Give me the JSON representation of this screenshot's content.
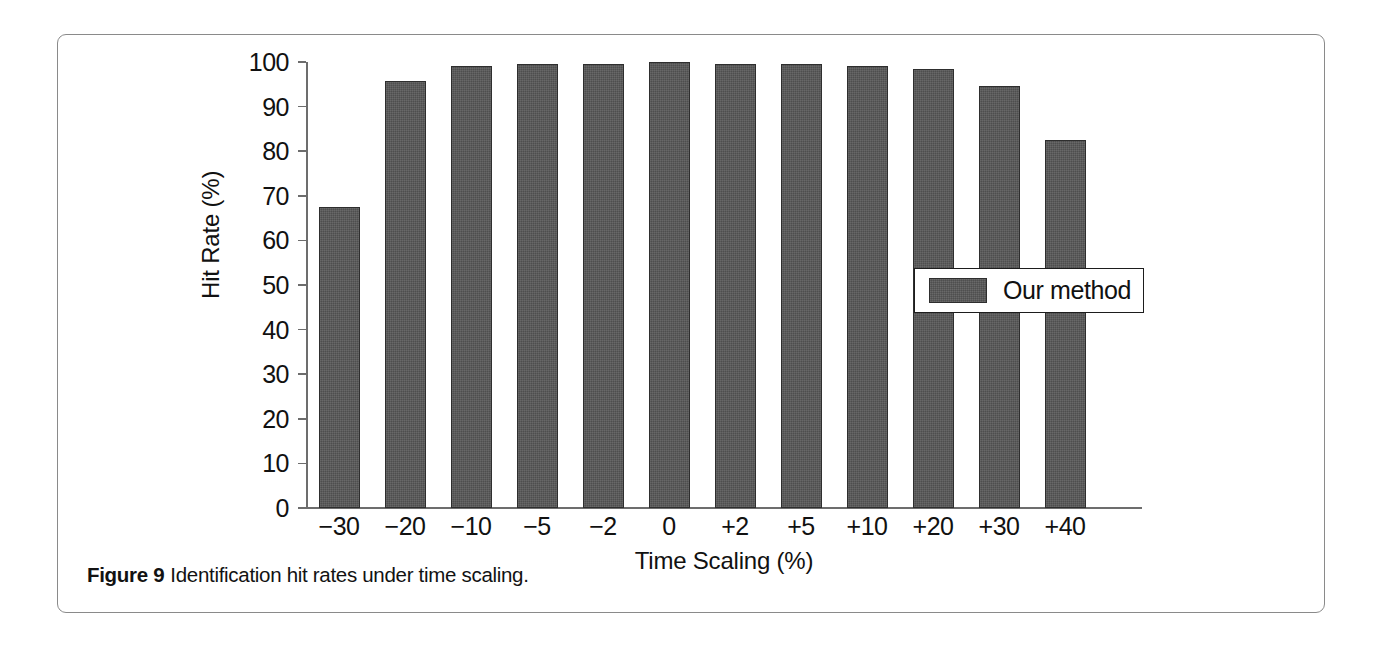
{
  "figure": {
    "caption_label": "Figure 9",
    "caption_text": "Identification hit rates under time scaling."
  },
  "legend": {
    "position": "inside-right",
    "entries": [
      {
        "label": "Our method",
        "color": "#575757"
      }
    ]
  },
  "colors": {
    "bar_fill": "#575757",
    "bar_stroke": "#2e2e2e",
    "axis": "#6d6d6d",
    "text": "#111111",
    "card_border": "#8a8a8a",
    "background": "#ffffff"
  },
  "chart_data": {
    "type": "bar",
    "title": "",
    "xlabel": "Time Scaling (%)",
    "ylabel": "Hit Rate (%)",
    "categories": [
      "−30",
      "−20",
      "−10",
      "−5",
      "−2",
      "0",
      "+2",
      "+5",
      "+10",
      "+20",
      "+30",
      "+40"
    ],
    "series": [
      {
        "name": "Our method",
        "values": [
          67.6,
          95.8,
          99.0,
          99.5,
          99.6,
          100.0,
          99.5,
          99.5,
          99.1,
          98.4,
          94.6,
          82.6
        ]
      }
    ],
    "ylim": [
      0,
      100
    ],
    "yticks": [
      0,
      10,
      20,
      30,
      40,
      50,
      60,
      70,
      80,
      90,
      100
    ],
    "ytick_labels": [
      "0",
      "10",
      "20",
      "30",
      "40",
      "50",
      "60",
      "70",
      "80",
      "90",
      "100"
    ],
    "grid": false,
    "legend_position": "inside-right"
  }
}
